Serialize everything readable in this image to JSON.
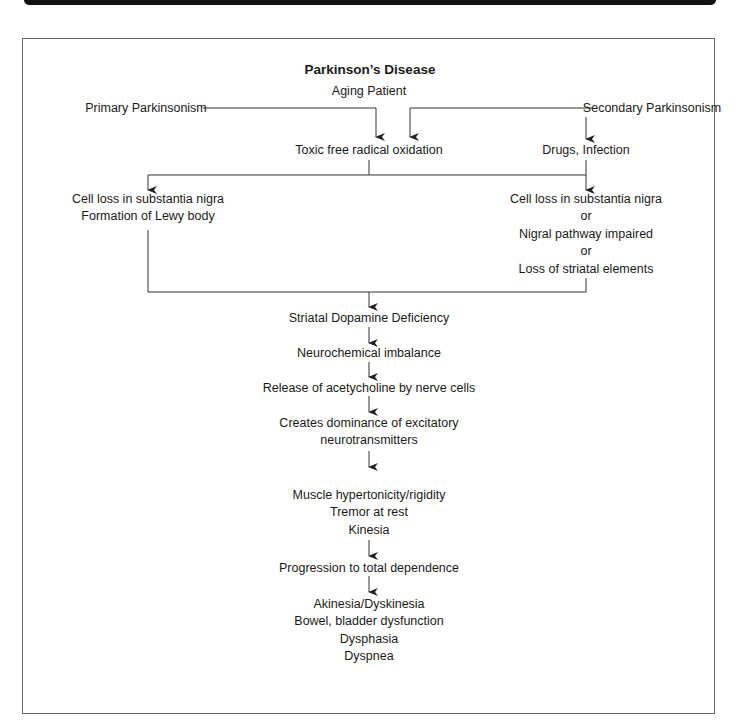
{
  "title": "Parkinson’s Disease",
  "nodes": {
    "aging_patient": "Aging Patient",
    "primary": "Primary Parkinsonism",
    "secondary": "Secondary Parkinsonism",
    "toxic": "Toxic free radical oxidation",
    "drugs": "Drugs, Infection",
    "left_branch": [
      "Cell loss in substantia nigra",
      "Formation of Lewy body"
    ],
    "right_branch": [
      "Cell loss in substantia nigra",
      "or",
      "Nigral pathway impaired",
      "or",
      "Loss of striatal elements"
    ],
    "striatal": "Striatal Dopamine Deficiency",
    "neurochemical": "Neurochemical imbalance",
    "release": "Release of acetycholine by nerve cells",
    "dominance": [
      "Creates dominance of excitatory",
      "neurotransmitters"
    ],
    "symptoms": [
      "Muscle hypertonicity/rigidity",
      "Tremor at rest",
      "Kinesia"
    ],
    "progression": "Progression to total dependence",
    "final": [
      "Akinesia/Dyskinesia",
      "Bowel, bladder dysfunction",
      "Dysphasia",
      "Dyspnea"
    ]
  },
  "colors": {
    "line": "#333333",
    "text": "#1a1a1a",
    "border": "#666666"
  }
}
